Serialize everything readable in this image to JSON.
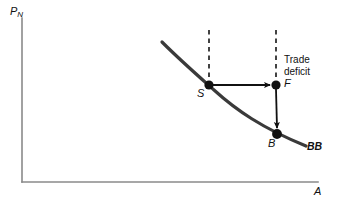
{
  "figure": {
    "title": "",
    "background_color": "#ffffff",
    "axis_color": "#8a8a8a",
    "curve_color": "#3a3a3a",
    "arrow_color": "#111111",
    "dash_color": "#222222",
    "text_color": "#111111"
  },
  "axes": {
    "y_label": "P",
    "y_label_subscript": "N",
    "x_label": "A",
    "origin": {
      "x": 22,
      "y": 182
    },
    "y_top": {
      "x": 22,
      "y": 18
    },
    "x_right": {
      "x": 318,
      "y": 182
    }
  },
  "curve": {
    "name": "BB",
    "label": "BB",
    "label_position": {
      "x": 309,
      "y": 142
    },
    "start": {
      "x": 162,
      "y": 42
    },
    "end": {
      "x": 306,
      "y": 146
    }
  },
  "points": [
    {
      "id": "S",
      "label": "S",
      "x": 209,
      "y": 85,
      "label_position": {
        "x": 198,
        "y": 90
      }
    },
    {
      "id": "F",
      "label": "F",
      "x": 276,
      "y": 85,
      "label_position": {
        "x": 284,
        "y": 78
      }
    },
    {
      "id": "B",
      "label": "B",
      "x": 277,
      "y": 134,
      "label_position": {
        "x": 269,
        "y": 139
      }
    }
  ],
  "dashed_lines": [
    {
      "name": "dashed-line-S",
      "x": 209,
      "y_top": 30,
      "y_bottom": 85
    },
    {
      "name": "dashed-line-F",
      "x": 276,
      "y_top": 30,
      "y_bottom": 85
    }
  ],
  "arrows": [
    {
      "name": "arrow-S-to-F",
      "from": {
        "x": 211,
        "y": 85
      },
      "to": {
        "x": 273,
        "y": 85
      },
      "direction": "right"
    },
    {
      "name": "arrow-F-to-B",
      "from": {
        "x": 276,
        "y": 88
      },
      "to": {
        "x": 277,
        "y": 131
      },
      "direction": "down"
    }
  ],
  "annotations": [
    {
      "id": "trade-deficit",
      "line1": "Trade",
      "line2": "deficit",
      "position": {
        "x": 284,
        "y": 55
      }
    }
  ]
}
